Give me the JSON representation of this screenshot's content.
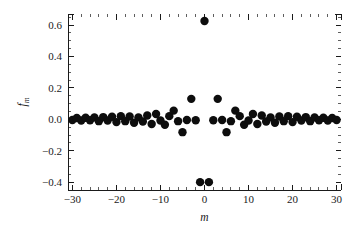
{
  "chart_data": {
    "type": "scatter",
    "title": "",
    "subtitle": "",
    "xlabel": "m",
    "ylabel": "f_m",
    "ylabel_base": "f",
    "ylabel_subscript": "m",
    "xlim": [
      -31,
      31
    ],
    "ylim": [
      -0.45,
      0.67
    ],
    "grid": false,
    "legend": null,
    "marker": "filled-circle",
    "marker_color": "#0d0d0d",
    "marker_size_px": 4.2,
    "xticks": [
      -30,
      -20,
      -10,
      0,
      10,
      20,
      30
    ],
    "xtick_labels": [
      "-30",
      "-20",
      "-10",
      "0",
      "10",
      "20",
      "30"
    ],
    "yticks": [
      -0.4,
      -0.2,
      0.0,
      0.2,
      0.4,
      0.6
    ],
    "ytick_labels": [
      "-0.4",
      "-0.2",
      "0.0",
      "0.2",
      "0.4",
      "0.6"
    ],
    "x_minor_step": 2,
    "y_minor_step": 0.05,
    "x": [
      -30,
      -29,
      -28,
      -27,
      -26,
      -25,
      -24,
      -23,
      -22,
      -21,
      -20,
      -19,
      -18,
      -17,
      -16,
      -15,
      -14,
      -13,
      -12,
      -11,
      -10,
      -9,
      -8,
      -7,
      -6,
      -5,
      -4,
      -3,
      -2,
      -1,
      0,
      1,
      2,
      3,
      4,
      5,
      6,
      7,
      8,
      9,
      10,
      11,
      12,
      13,
      14,
      15,
      16,
      17,
      18,
      19,
      20,
      21,
      22,
      23,
      24,
      25,
      26,
      27,
      28,
      29,
      30
    ],
    "y": [
      -0.005,
      0.008,
      -0.008,
      0.01,
      -0.006,
      0.012,
      -0.012,
      0.014,
      -0.008,
      0.016,
      -0.018,
      0.02,
      -0.012,
      0.018,
      -0.022,
      0.012,
      -0.014,
      0.024,
      -0.03,
      0.034,
      -0.008,
      -0.035,
      0.02,
      0.055,
      -0.012,
      -0.082,
      -0.005,
      0.13,
      -0.006,
      -0.4,
      0.625,
      -0.4,
      -0.006,
      0.13,
      -0.005,
      -0.082,
      -0.012,
      0.055,
      0.02,
      -0.035,
      -0.008,
      0.034,
      -0.03,
      0.024,
      -0.014,
      0.012,
      -0.022,
      0.018,
      -0.012,
      0.02,
      -0.018,
      0.016,
      -0.008,
      0.014,
      -0.012,
      0.012,
      -0.006,
      0.01,
      -0.008,
      0.008,
      -0.005
    ]
  }
}
